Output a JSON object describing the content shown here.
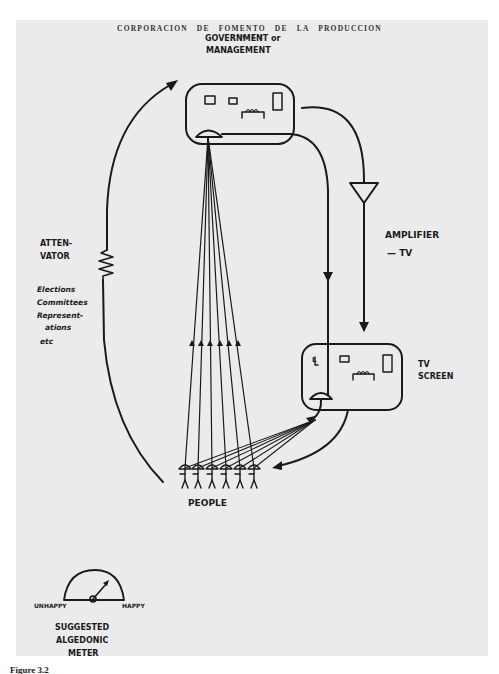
{
  "header": {
    "line1": "CORPORACION  DE  FOMENTO  DE  LA  PRODUCCION",
    "line2": "CHILE"
  },
  "diagram": {
    "government_label_1": "GOVERNMENT or",
    "government_label_2": "MANAGEMENT",
    "amplifier_label": "AMPLIFIER",
    "amplifier_sub": "— TV",
    "tv_label_1": "TV",
    "tv_label_2": "SCREEN",
    "attenuator_label_1": "ATTEN-",
    "attenuator_label_2": "VATOR",
    "channels": [
      "Elections",
      "Committees",
      "Represent-",
      "ations",
      "etc"
    ],
    "people_label": "PEOPLE",
    "people_count": 6,
    "tv_screen_letter": "L",
    "meter": {
      "left_label": "UNHAPPY",
      "right_label": "HAPPY",
      "title_1": "SUGGESTED",
      "title_2": "ALGEDONIC",
      "title_3": "METER"
    }
  },
  "caption": "Figure 3.2",
  "colors": {
    "paper": "#ebebeb",
    "ink": "#1a1a1a",
    "background": "#ffffff"
  }
}
